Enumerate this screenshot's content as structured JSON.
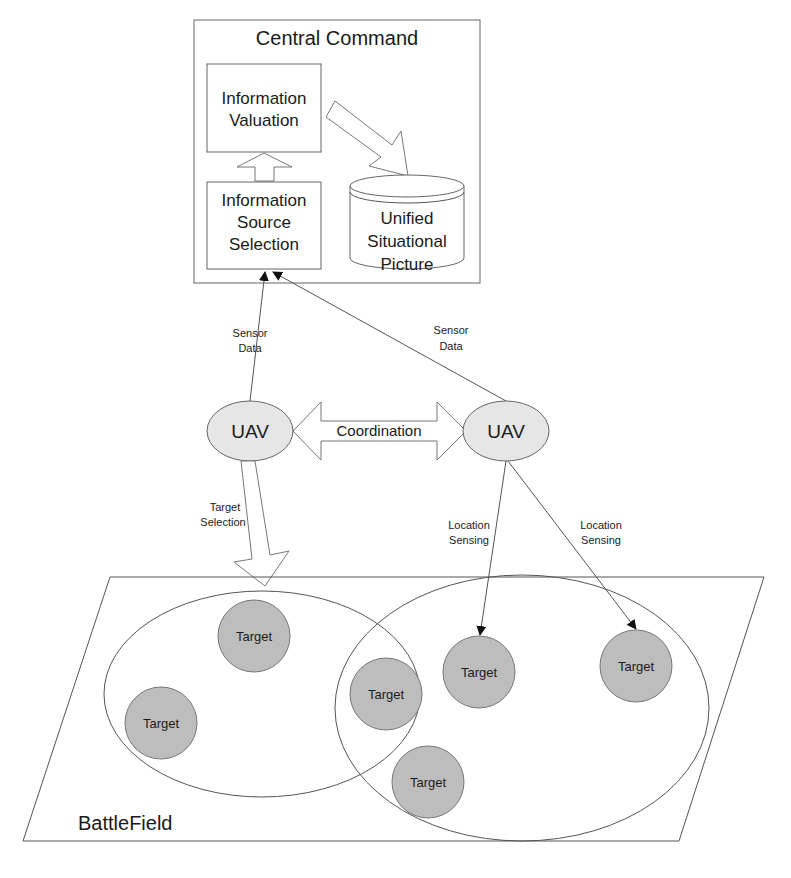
{
  "central_command": {
    "title": "Central Command",
    "information_valuation": [
      "Information",
      "Valuation"
    ],
    "information_source_selection": [
      "Information",
      "Source",
      "Selection"
    ],
    "unified_situational_picture": [
      "Unified",
      "Situational",
      "Picture"
    ]
  },
  "links": {
    "sensor_data_left": [
      "Sensor",
      "Data"
    ],
    "sensor_data_right": [
      "Sensor",
      "Data"
    ],
    "coordination": "Coordination",
    "target_selection": [
      "Target",
      "Selection"
    ],
    "location_sensing_1": [
      "Location",
      "Sensing"
    ],
    "location_sensing_2": [
      "Location",
      "Sensing"
    ]
  },
  "uavs": [
    {
      "label": "UAV"
    },
    {
      "label": "UAV"
    }
  ],
  "battlefield": {
    "label": "BattleField",
    "targets": [
      {
        "label": "Target"
      },
      {
        "label": "Target"
      },
      {
        "label": "Target"
      },
      {
        "label": "Target"
      },
      {
        "label": "Target"
      },
      {
        "label": "Target"
      }
    ]
  },
  "colors": {
    "line": "#555555",
    "uav_fill": "#e6e6e6",
    "target_fill": "#bdbdbd"
  }
}
